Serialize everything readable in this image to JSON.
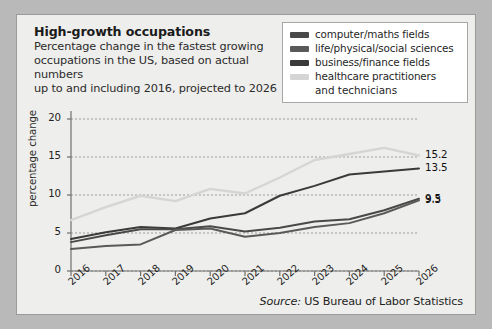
{
  "figure": {
    "title": "High-growth occupations",
    "subtitle": "Percentage change in the fastest growing occupations in the US, based on actual numbers up to and including 2026, projected to 2026",
    "subtitle_lines": [
      "Percentage change in the fastest growing",
      "occupations in the US, based on actual numbers",
      "up to and including 2016, projected to 2026"
    ],
    "source_prefix": "Source:",
    "source_text": "US Bureau of Labor Statistics",
    "background": "#eeeeec",
    "page_background": "#b9b9b9"
  },
  "legend": {
    "position": "top-right",
    "entries": [
      {
        "label": "computer/maths fields",
        "color": "#494949"
      },
      {
        "label": "life/physical/social sciences",
        "color": "#5a5a5a"
      },
      {
        "label": "business/finance fields",
        "color": "#3a3a3a"
      },
      {
        "label": "healthcare practitioners",
        "label_cont": "and technicians",
        "color": "#d5d5d5"
      }
    ]
  },
  "chart_data": {
    "type": "line",
    "title": "High-growth occupations",
    "xlabel": "",
    "ylabel": "percentage change",
    "x": [
      "2016",
      "2017",
      "2018",
      "2019",
      "2020",
      "2021",
      "2022",
      "2023",
      "2024",
      "2025",
      "2026"
    ],
    "xlim": [
      2016,
      2026
    ],
    "ylim": [
      0,
      20
    ],
    "yticks": [
      0,
      5,
      10,
      15,
      20
    ],
    "grid": true,
    "grid_style": "dotted-horizontal",
    "series": [
      {
        "name": "healthcare practitioners and technicians",
        "color": "#d5d5d5",
        "values": [
          6.7,
          8.4,
          9.9,
          9.2,
          10.8,
          10.2,
          12.3,
          14.6,
          15.4,
          16.2,
          15.2
        ],
        "end_label": "15.2"
      },
      {
        "name": "business/finance fields",
        "color": "#3a3a3a",
        "values": [
          4.2,
          5.1,
          5.8,
          5.6,
          6.9,
          7.6,
          9.9,
          11.2,
          12.7,
          13.1,
          13.5
        ],
        "end_label": "13.5"
      },
      {
        "name": "computer/maths fields",
        "color": "#494949",
        "values": [
          3.8,
          4.7,
          5.5,
          5.5,
          5.9,
          5.2,
          5.7,
          6.5,
          6.8,
          8.0,
          9.5
        ],
        "end_label": "9.5"
      },
      {
        "name": "life/physical/social sciences",
        "color": "#5a5a5a",
        "values": [
          2.9,
          3.3,
          3.5,
          5.4,
          5.6,
          4.5,
          5.0,
          5.8,
          6.3,
          7.6,
          9.3
        ],
        "end_label": "9.3"
      }
    ],
    "end_labels": [
      "15.2",
      "13.5",
      "9.5",
      "9.3"
    ]
  }
}
